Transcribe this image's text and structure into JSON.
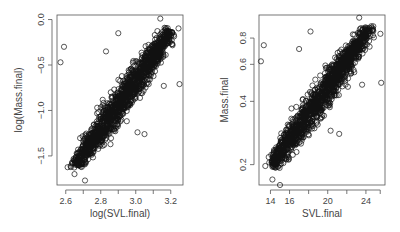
{
  "chart_data": [
    {
      "type": "scatter",
      "title": "",
      "xlabel": "log(SVL.final)",
      "ylabel": "log(Mass.final)",
      "xlim": [
        2.55,
        3.27
      ],
      "ylim": [
        -1.82,
        0.05
      ],
      "x_ticks": [
        2.6,
        2.8,
        3.0,
        3.2
      ],
      "x_tick_labels": [
        "2.6",
        "2.8",
        "3.0",
        "3.2"
      ],
      "x_minor_ticks": [
        2.7,
        2.9,
        3.1
      ],
      "y_ticks": [
        -1.5,
        -1.0,
        -0.5,
        0.0
      ],
      "y_tick_labels": [
        "-1.5",
        "-1.0",
        "-0.5",
        "0.0"
      ],
      "grid": false,
      "trend": {
        "x0": 2.68,
        "y0": -1.55,
        "x1": 3.17,
        "y1": -0.2
      },
      "outliers": [
        [
          2.57,
          -0.47
        ],
        [
          2.59,
          -0.3
        ],
        [
          2.83,
          -0.35
        ],
        [
          2.9,
          -0.15
        ],
        [
          3.25,
          -0.71
        ],
        [
          2.65,
          -1.7
        ],
        [
          2.71,
          -1.77
        ],
        [
          3.01,
          -1.24
        ],
        [
          3.05,
          -1.26
        ],
        [
          2.78,
          -0.97
        ],
        [
          3.16,
          -0.73
        ],
        [
          3.14,
          0.01
        ]
      ]
    },
    {
      "type": "scatter",
      "title": "",
      "xlabel": "SVL.final",
      "ylabel": "Mass.final",
      "xlim": [
        12.8,
        26.0
      ],
      "ylim": [
        0.16,
        1.03
      ],
      "y_scale": "log",
      "x_ticks": [
        14,
        16,
        20,
        24
      ],
      "x_tick_labels": [
        "14",
        "16",
        "20",
        "24"
      ],
      "x_minor_ticks": [
        18,
        22,
        25.5
      ],
      "y_ticks": [
        0.2,
        0.4,
        0.6,
        0.8
      ],
      "y_tick_labels": [
        "0.2",
        "0.4",
        "0.6",
        "0.8"
      ],
      "grid": false,
      "trend": {
        "x0": 14.6,
        "y0": 0.21,
        "x1": 23.8,
        "y1": 0.82
      },
      "outliers": [
        [
          13.0,
          0.62
        ],
        [
          13.3,
          0.74
        ],
        [
          17.0,
          0.71
        ],
        [
          18.2,
          0.86
        ],
        [
          25.6,
          0.49
        ],
        [
          14.2,
          0.17
        ],
        [
          15.0,
          0.16
        ],
        [
          20.3,
          0.29
        ],
        [
          21.2,
          0.28
        ],
        [
          16.2,
          0.37
        ],
        [
          23.6,
          0.48
        ],
        [
          23.3,
          1.0
        ]
      ]
    }
  ]
}
